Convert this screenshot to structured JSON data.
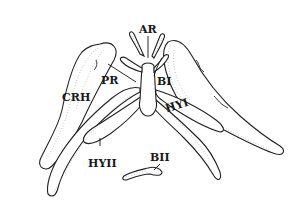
{
  "figure": {
    "type": "anatomical line drawing",
    "labels": {
      "ar": "AR",
      "pr": "PR",
      "crh": "CRH",
      "bi": "BI",
      "hyi": "HYI",
      "hyii": "HYII",
      "bii": "BII"
    }
  },
  "colors": {
    "ink": "#222222",
    "stipple": "#888888",
    "background": "#ffffff"
  }
}
